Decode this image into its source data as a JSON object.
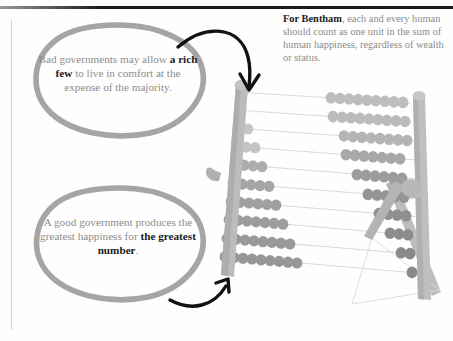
{
  "page": {
    "background": "#fefefe",
    "rule_color": "#1a1a1a",
    "margin_rule_color": "#d2d2d2"
  },
  "annotations": {
    "bentham_note": {
      "lead_bold": "For Bentham",
      "rest": ", each and every human should count as one unit in the sum of human happiness, regardless of wealth or status.",
      "full_text": "For Bentham, each and every human should count as one unit in the sum of human happiness, regardless of wealth or status.",
      "color": "#8c8c8c",
      "bold_color": "#1b1b1b"
    }
  },
  "bubbles": [
    {
      "id": "bad-governments",
      "segments": [
        {
          "text": "Bad governments ",
          "bold": false
        },
        {
          "text": "may allow ",
          "bold": false
        },
        {
          "text": "a rich few",
          "bold": true
        },
        {
          "text": " to live in comfort at the expense of the majority.",
          "bold": false
        }
      ],
      "full_text": "Bad governments may allow a rich few to live in comfort at the expense of the majority.",
      "outline_color": "#a5a5a5",
      "text_color": "#8c8c8c",
      "bold_color": "#1b1b1b"
    },
    {
      "id": "good-government",
      "segments": [
        {
          "text": "A good government ",
          "bold": false
        },
        {
          "text": "produces the greatest ",
          "bold": false
        },
        {
          "text": "happiness for ",
          "bold": false
        },
        {
          "text": "the greatest number",
          "bold": true
        },
        {
          "text": ".",
          "bold": false
        }
      ],
      "full_text": "A good government produces the greatest happiness for the greatest number.",
      "outline_color": "#a5a5a5",
      "text_color": "#8c8c8c",
      "bold_color": "#1b1b1b"
    }
  ],
  "arrows": [
    {
      "id": "arrow-top",
      "from": "bad-governments-bubble",
      "to": "abacus-top-rows",
      "color": "#111111"
    },
    {
      "id": "arrow-bottom",
      "from": "good-government-bubble",
      "to": "abacus-bottom-rows",
      "color": "#111111"
    }
  ],
  "abacus": {
    "label": "abacus illustration",
    "frame_color": "#b9b9b9",
    "frame_shadow_color": "#a6a6a6",
    "rod_color": "#cfcfcf",
    "stand_color": "#b4b4b4",
    "rows_count": 10,
    "rows": [
      {
        "index": 1,
        "left_beads": 1,
        "right_beads": 9,
        "left_bead_color": "#c9c9c9",
        "right_bead_color": "#bdbdbd"
      },
      {
        "index": 2,
        "left_beads": 1,
        "right_beads": 9,
        "left_bead_color": "#c9c9c9",
        "right_bead_color": "#bbbbbb"
      },
      {
        "index": 3,
        "left_beads": 2,
        "right_beads": 8,
        "left_bead_color": "#c6c6c6",
        "right_bead_color": "#b4b4b4"
      },
      {
        "index": 4,
        "left_beads": 3,
        "right_beads": 7,
        "left_bead_color": "#c4c4c4",
        "right_bead_color": "#a8a8a8"
      },
      {
        "index": 5,
        "left_beads": 4,
        "right_beads": 6,
        "left_bead_color": "#adadad",
        "right_bead_color": "#9c9c9c"
      },
      {
        "index": 6,
        "left_beads": 5,
        "right_beads": 5,
        "left_bead_color": "#a5a5a5",
        "right_bead_color": "#949494"
      },
      {
        "index": 7,
        "left_beads": 6,
        "right_beads": 4,
        "left_bead_color": "#a0a0a0",
        "right_bead_color": "#8f8f8f"
      },
      {
        "index": 8,
        "left_beads": 7,
        "right_beads": 3,
        "left_bead_color": "#9c9c9c",
        "right_bead_color": "#8c8c8c"
      },
      {
        "index": 9,
        "left_beads": 8,
        "right_beads": 2,
        "left_bead_color": "#999999",
        "right_bead_color": "#8a8a8a"
      },
      {
        "index": 10,
        "left_beads": 9,
        "right_beads": 1,
        "left_bead_color": "#979797",
        "right_bead_color": "#888888"
      }
    ]
  }
}
